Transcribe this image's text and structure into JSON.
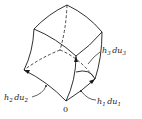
{
  "diagram": {
    "origin_label": "0",
    "labels": {
      "h1": {
        "coef": "h",
        "coef_sub": "1",
        "diff": "du",
        "diff_sub": "1"
      },
      "h2": {
        "coef": "h",
        "coef_sub": "2",
        "diff": "du",
        "diff_sub": "2"
      },
      "h3": {
        "coef": "h",
        "coef_sub": "3",
        "diff": "du",
        "diff_sub": "3"
      }
    },
    "colors": {
      "ink": "#1a1a1a",
      "background": "#ffffff"
    }
  }
}
